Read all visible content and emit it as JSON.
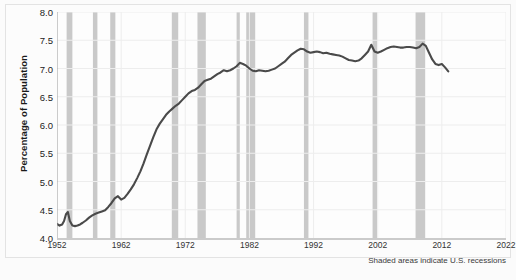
{
  "figure": {
    "background_color": "#fbfbfb",
    "plot_background_color": "#fdfdfd",
    "border_color": "#e3e3e3"
  },
  "caption": "Shaded areas indicate U.S. recessions",
  "chart_data": {
    "type": "line",
    "title": "",
    "xlabel": "",
    "ylabel": "Percentage of Population",
    "xlim": [
      1952,
      2022
    ],
    "ylim": [
      4.0,
      8.0
    ],
    "grid": true,
    "legend": "none",
    "line_color": "#4a4a4a",
    "recession_band_color": "#c9c9c9",
    "gridline_color": "#ededed",
    "yticks": [
      "4.0",
      "4.5",
      "5.0",
      "5.5",
      "6.0",
      "6.5",
      "7.0",
      "7.5",
      "8.0"
    ],
    "ytick_values": [
      4.0,
      4.5,
      5.0,
      5.5,
      6.0,
      6.5,
      7.0,
      7.5,
      8.0
    ],
    "xticks": [
      "1952",
      "1962",
      "1972",
      "1982",
      "1992",
      "2002",
      "2012",
      "2022"
    ],
    "xtick_values": [
      1952,
      1962,
      1972,
      1982,
      1992,
      2002,
      2012,
      2022
    ],
    "series": [
      {
        "name": "Percentage of Population",
        "x": [
          1952.0,
          1952.4,
          1952.8,
          1953.1,
          1953.4,
          1953.7,
          1954.0,
          1954.4,
          1954.8,
          1955.2,
          1955.6,
          1956.0,
          1956.5,
          1957.0,
          1957.5,
          1958.0,
          1958.5,
          1959.0,
          1959.5,
          1960.0,
          1960.5,
          1961.0,
          1961.5,
          1962.0,
          1962.5,
          1963.0,
          1963.5,
          1964.0,
          1964.5,
          1965.0,
          1965.5,
          1966.0,
          1966.5,
          1967.0,
          1967.5,
          1968.0,
          1968.5,
          1969.0,
          1969.5,
          1970.0,
          1970.5,
          1971.0,
          1971.5,
          1972.0,
          1972.5,
          1973.0,
          1973.5,
          1974.0,
          1974.5,
          1975.0,
          1975.5,
          1976.0,
          1976.5,
          1977.0,
          1977.5,
          1978.0,
          1978.5,
          1979.0,
          1979.5,
          1980.0,
          1980.5,
          1981.0,
          1981.5,
          1982.0,
          1982.5,
          1983.0,
          1983.5,
          1984.0,
          1984.5,
          1985.0,
          1985.5,
          1986.0,
          1986.5,
          1987.0,
          1987.5,
          1988.0,
          1988.5,
          1989.0,
          1989.5,
          1990.0,
          1990.5,
          1991.0,
          1991.5,
          1992.0,
          1992.5,
          1993.0,
          1993.5,
          1994.0,
          1994.5,
          1995.0,
          1995.5,
          1996.0,
          1996.5,
          1997.0,
          1997.5,
          1998.0,
          1998.5,
          1999.0,
          1999.5,
          2000.0,
          2000.5,
          2001.0,
          2001.5,
          2002.0,
          2002.5,
          2003.0,
          2003.5,
          2004.0,
          2004.5,
          2005.0,
          2005.5,
          2006.0,
          2006.5,
          2007.0,
          2007.5,
          2008.0,
          2008.5,
          2009.0,
          2009.5,
          2010.0,
          2010.5,
          2011.0,
          2011.5,
          2012.0,
          2012.5,
          2013.0
        ],
        "values": [
          4.25,
          4.22,
          4.24,
          4.3,
          4.42,
          4.46,
          4.3,
          4.22,
          4.21,
          4.22,
          4.24,
          4.27,
          4.31,
          4.36,
          4.4,
          4.43,
          4.45,
          4.47,
          4.49,
          4.55,
          4.62,
          4.7,
          4.74,
          4.68,
          4.71,
          4.78,
          4.86,
          4.95,
          5.06,
          5.18,
          5.32,
          5.48,
          5.63,
          5.78,
          5.92,
          6.02,
          6.1,
          6.18,
          6.24,
          6.29,
          6.34,
          6.38,
          6.44,
          6.5,
          6.56,
          6.6,
          6.62,
          6.66,
          6.72,
          6.78,
          6.8,
          6.82,
          6.86,
          6.9,
          6.93,
          6.97,
          6.95,
          6.97,
          7.0,
          7.04,
          7.1,
          7.08,
          7.05,
          7.0,
          6.96,
          6.95,
          6.97,
          6.96,
          6.95,
          6.96,
          6.98,
          7.0,
          7.04,
          7.08,
          7.12,
          7.18,
          7.24,
          7.28,
          7.32,
          7.35,
          7.34,
          7.3,
          7.28,
          7.29,
          7.3,
          7.29,
          7.27,
          7.28,
          7.26,
          7.25,
          7.24,
          7.23,
          7.21,
          7.18,
          7.15,
          7.14,
          7.13,
          7.14,
          7.18,
          7.24,
          7.3,
          7.42,
          7.3,
          7.28,
          7.3,
          7.33,
          7.36,
          7.38,
          7.39,
          7.38,
          7.37,
          7.37,
          7.38,
          7.38,
          7.37,
          7.36,
          7.38,
          7.44,
          7.4,
          7.28,
          7.16,
          7.08,
          7.06,
          7.08,
          7.02,
          6.95
        ]
      }
    ],
    "recessions": [
      {
        "start": 1953.5,
        "end": 1954.4
      },
      {
        "start": 1957.6,
        "end": 1958.3
      },
      {
        "start": 1960.3,
        "end": 1961.1
      },
      {
        "start": 1969.9,
        "end": 1970.9
      },
      {
        "start": 1973.9,
        "end": 1975.2
      },
      {
        "start": 1980.0,
        "end": 1980.5
      },
      {
        "start": 1981.5,
        "end": 1982.9
      },
      {
        "start": 1990.5,
        "end": 1991.2
      },
      {
        "start": 2001.2,
        "end": 2001.9
      },
      {
        "start": 2007.9,
        "end": 2009.4
      }
    ]
  }
}
